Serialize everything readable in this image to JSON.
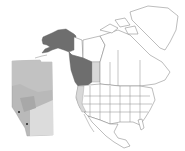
{
  "map": {
    "title": "",
    "colors": {
      "background": "#ffffff",
      "highlight_dark": "#6e6e6e",
      "highlight_light": "#d8d8d8",
      "outline": "#7a7a7a",
      "inset_base": "#b4b4b4",
      "inset_light": "#dcdcdc"
    },
    "regions": [
      {
        "name": "Alaska",
        "shade": "dark"
      },
      {
        "name": "British Columbia",
        "shade": "dark"
      },
      {
        "name": "Alberta",
        "shade": "light"
      },
      {
        "name": "Washington/Oregon/California coast",
        "shade": "light"
      },
      {
        "name": "Yukon",
        "shade": "none"
      },
      {
        "name": "Greenland",
        "shade": "none"
      },
      {
        "name": "Contiguous United States",
        "shade": "none"
      },
      {
        "name": "Mexico",
        "shade": "none"
      }
    ],
    "inset": {
      "name": "Alberta inset",
      "markers": 2
    }
  }
}
